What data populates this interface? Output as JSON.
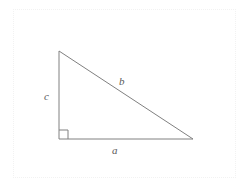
{
  "figure": {
    "type": "right-triangle-diagram",
    "background_color": "#ffffff",
    "stroke_color": "#808080",
    "label_color": "#5a5a5a",
    "frame": {
      "visible": true,
      "style": "dotted",
      "color": "#f2f2f2",
      "x": 13,
      "y": 9,
      "width": 223,
      "height": 169
    },
    "vertices": {
      "top": {
        "x": 59,
        "y": 51
      },
      "bottom_left": {
        "x": 59,
        "y": 139
      },
      "bottom_right": {
        "x": 193,
        "y": 139
      }
    },
    "right_angle_marker": {
      "at": "bottom_left",
      "size": 9,
      "visible": true
    },
    "labels": {
      "vertical_leg": "c",
      "hypotenuse": "b",
      "horizontal_leg": "a"
    }
  }
}
